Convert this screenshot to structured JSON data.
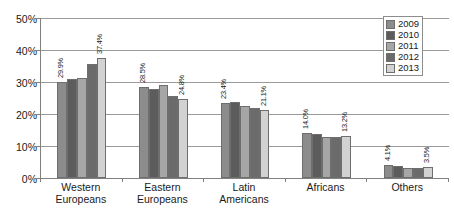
{
  "chart_data": {
    "type": "bar",
    "title": "",
    "subtitle": "",
    "xlabel": "",
    "ylabel": "",
    "ylim": [
      0,
      50
    ],
    "ytick_values": [
      50,
      40,
      30,
      20,
      10,
      0
    ],
    "ytick_labels": [
      "50%",
      "40%",
      "30%",
      "20%",
      "10%",
      "0%"
    ],
    "grid": "horizontal",
    "legend_position": "top-right",
    "value_suffix": "%",
    "categories": [
      "Western Europeans",
      "Eastern Europeans",
      "Latin Americans",
      "Africans",
      "Others"
    ],
    "category_lines": [
      [
        "Western",
        "Europeans"
      ],
      [
        "Eastern",
        "Europeans"
      ],
      [
        "Latin",
        "Americans"
      ],
      [
        "Africans",
        ""
      ],
      [
        "Others",
        ""
      ]
    ],
    "series": [
      {
        "name": "2009",
        "color": "#8c8c8c",
        "values": [
          29.9,
          28.5,
          23.4,
          14.0,
          4.1
        ],
        "labels": [
          "29.9%",
          "28.5%",
          "23.4%",
          "14.0%",
          "4.1%"
        ],
        "label_shown": [
          true,
          true,
          true,
          true,
          true
        ]
      },
      {
        "name": "2010",
        "color": "#5c5c5c",
        "values": [
          30.8,
          27.8,
          23.7,
          13.6,
          3.6
        ],
        "labels": [
          "30.8%",
          "27.8%",
          "23.7%",
          "13.6%",
          "3.6%"
        ],
        "label_shown": [
          false,
          false,
          false,
          false,
          false
        ]
      },
      {
        "name": "2011",
        "color": "#a6a6a6",
        "values": [
          31.3,
          29.2,
          22.5,
          12.7,
          3.2
        ],
        "labels": [
          "31.3%",
          "29.2%",
          "22.5%",
          "12.7%",
          "3.2%"
        ],
        "label_shown": [
          false,
          false,
          false,
          false,
          false
        ]
      },
      {
        "name": "2012",
        "color": "#6b6b6b",
        "values": [
          35.6,
          25.6,
          21.8,
          12.7,
          3.2
        ],
        "labels": [
          "35.6%",
          "25.6%",
          "21.8%",
          "12.7%",
          "3.2%"
        ],
        "label_shown": [
          false,
          false,
          false,
          false,
          false
        ]
      },
      {
        "name": "2013",
        "color": "#d2d2d2",
        "values": [
          37.4,
          24.8,
          21.1,
          13.2,
          3.5
        ],
        "labels": [
          "37.4%",
          "24.8%",
          "21.1%",
          "13.2%",
          "3.5%"
        ],
        "label_shown": [
          true,
          true,
          true,
          true,
          true
        ]
      }
    ]
  },
  "legend": {
    "items": [
      {
        "label": "2009",
        "color": "#8c8c8c"
      },
      {
        "label": "2010",
        "color": "#5c5c5c"
      },
      {
        "label": "2011",
        "color": "#a6a6a6"
      },
      {
        "label": "2012",
        "color": "#6b6b6b"
      },
      {
        "label": "2013",
        "color": "#d2d2d2"
      }
    ]
  }
}
